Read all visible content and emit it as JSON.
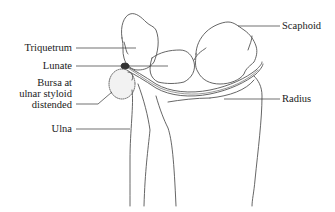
{
  "figure": {
    "labels": {
      "triquetrum": "Triquetrum",
      "lunate": "Lunate",
      "bursa_line1": "Bursa at",
      "bursa_line2": "ulnar styloid",
      "bursa_line3": "distended",
      "ulna": "Ulna",
      "scaphoid": "Scaphoid",
      "radius": "Radius"
    },
    "colors": {
      "line": "#555555",
      "text": "#1a1a1a",
      "background": "#ffffff"
    }
  }
}
